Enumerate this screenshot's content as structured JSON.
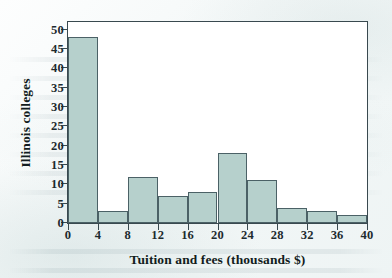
{
  "chart_data": {
    "type": "bar",
    "title": "",
    "xlabel": "Tuition and fees (thousands $)",
    "ylabel": "Illinois colleges",
    "categories": [
      "0-4",
      "4-8",
      "8-12",
      "12-16",
      "16-20",
      "20-24",
      "24-28",
      "28-32",
      "32-36",
      "36-40"
    ],
    "bin_edges": [
      0,
      4,
      8,
      12,
      16,
      20,
      24,
      28,
      32,
      36,
      40
    ],
    "values": [
      48,
      3,
      12,
      7,
      8,
      18,
      11,
      4,
      3,
      2
    ],
    "xlim": [
      0,
      40
    ],
    "ylim": [
      0,
      52
    ],
    "x_ticks": [
      0,
      4,
      8,
      12,
      16,
      20,
      24,
      28,
      32,
      36,
      40
    ],
    "y_ticks": [
      0,
      5,
      10,
      15,
      20,
      25,
      30,
      35,
      40,
      45,
      50
    ],
    "grid": false,
    "legend": null,
    "bar_fill_color": "#b6d0cc",
    "bar_border_color": "#4b6166",
    "axis_color": "#39494f",
    "plot_background": "#ffffff"
  }
}
